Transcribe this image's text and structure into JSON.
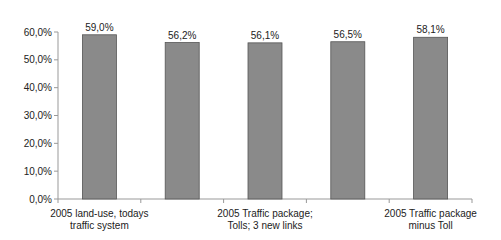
{
  "chart_data": {
    "type": "bar",
    "title": "",
    "xlabel": "",
    "ylabel": "",
    "ylim": [
      0,
      60
    ],
    "yticks": [
      "0,0%",
      "10,0%",
      "20,0%",
      "30,0%",
      "40,0%",
      "50,0%",
      "60,0%"
    ],
    "categories": [
      "2005 land-use, todays traffic system",
      "",
      "2005 Traffic package; Tolls; 3 new links",
      "",
      "2005 Traffic package minus Toll"
    ],
    "values": [
      59.0,
      56.2,
      56.1,
      56.5,
      58.1
    ],
    "value_labels": [
      "59,0%",
      "56,2%",
      "56,1%",
      "56,5%",
      "58,1%"
    ],
    "x_label_lines": [
      [
        "2005 land-use, todays",
        "traffic system"
      ],
      [],
      [
        "2005 Traffic package;",
        "Tolls; 3 new links"
      ],
      [],
      [
        "2005 Traffic package",
        "minus Toll"
      ]
    ],
    "bar_color": "#8a8a8a",
    "grid": false,
    "legend": "none"
  }
}
